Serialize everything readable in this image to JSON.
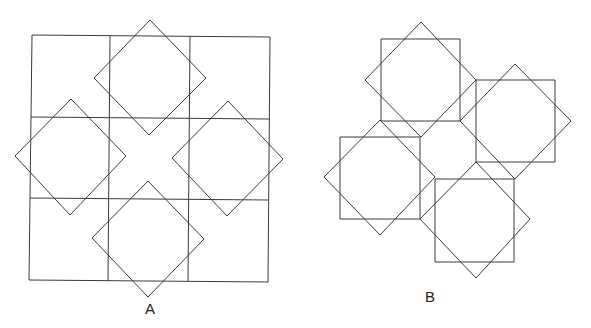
{
  "figures": [
    {
      "label": "A",
      "label_pos": [
        150,
        314
      ],
      "description": "3x3 grid of squares with four rotated squares (diamonds) overlaid",
      "grid": {
        "corners": [
          [
            32,
            35
          ],
          [
            270,
            37
          ],
          [
            268,
            282
          ],
          [
            29,
            280
          ]
        ],
        "v_lines": [
          [
            [
              110,
              36
            ],
            [
              108,
              281
            ]
          ],
          [
            [
              190,
              36
            ],
            [
              188,
              281
            ]
          ]
        ],
        "h_lines": [
          [
            [
              31,
              117
            ],
            [
              269,
              119
            ]
          ],
          [
            [
              30,
              198
            ],
            [
              268,
              200
            ]
          ]
        ]
      },
      "diamonds": [
        [
          [
            150,
            20
          ],
          [
            206,
            78
          ],
          [
            149,
            135
          ],
          [
            94,
            78
          ]
        ],
        [
          [
            71,
            99
          ],
          [
            126,
            156
          ],
          [
            70,
            215
          ],
          [
            15,
            156
          ]
        ],
        [
          [
            228,
            101
          ],
          [
            283,
            159
          ],
          [
            227,
            216
          ],
          [
            172,
            158
          ]
        ],
        [
          [
            148,
            181
          ],
          [
            204,
            239
          ],
          [
            148,
            297
          ],
          [
            92,
            238
          ]
        ]
      ]
    },
    {
      "label": "B",
      "label_pos": [
        430,
        302
      ],
      "description": "four squares each overlaid with a rotated square, arranged around a central octagonal gap",
      "squares": [
        [
          [
            381,
            39
          ],
          [
            460,
            39
          ],
          [
            460,
            121
          ],
          [
            381,
            121
          ]
        ],
        [
          [
            476,
            80
          ],
          [
            555,
            80
          ],
          [
            555,
            162
          ],
          [
            476,
            162
          ]
        ],
        [
          [
            340,
            137
          ],
          [
            420,
            137
          ],
          [
            420,
            219
          ],
          [
            340,
            219
          ]
        ],
        [
          [
            435,
            179
          ],
          [
            514,
            179
          ],
          [
            514,
            262
          ],
          [
            435,
            262
          ]
        ]
      ],
      "diamonds": [
        [
          [
            421,
            22
          ],
          [
            476,
            80
          ],
          [
            421,
            137
          ],
          [
            365,
            80
          ]
        ],
        [
          [
            515,
            64
          ],
          [
            571,
            121
          ],
          [
            515,
            179
          ],
          [
            460,
            121
          ]
        ],
        [
          [
            380,
            120
          ],
          [
            435,
            177
          ],
          [
            380,
            235
          ],
          [
            324,
            177
          ]
        ],
        [
          [
            476,
            162
          ],
          [
            530,
            219
          ],
          [
            476,
            278
          ],
          [
            420,
            219
          ]
        ]
      ]
    }
  ]
}
